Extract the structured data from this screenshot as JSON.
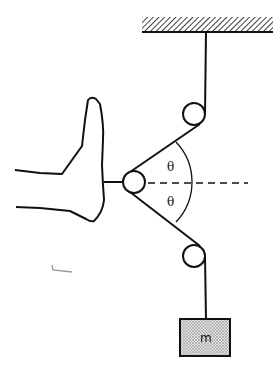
{
  "diagram": {
    "labels": {
      "angle_upper": "θ",
      "angle_lower": "θ",
      "mass": "m"
    },
    "components": {
      "ceiling": {
        "x1": 142,
        "x2": 273,
        "y_top": 17,
        "y_bottom": 32
      },
      "pulley_top": {
        "cx": 194,
        "cy": 114,
        "r": 11
      },
      "pulley_foot": {
        "cx": 134,
        "cy": 182,
        "r": 11
      },
      "pulley_bottom": {
        "cx": 194,
        "cy": 256,
        "r": 11
      },
      "mass_block": {
        "x": 180,
        "y": 319,
        "w": 50,
        "h": 37
      },
      "dashed_axis": {
        "x1": 148,
        "x2": 248,
        "y": 183
      }
    },
    "colors": {
      "line": "#111111",
      "mass_fill": "#c8c8c8",
      "background": "#ffffff"
    }
  }
}
